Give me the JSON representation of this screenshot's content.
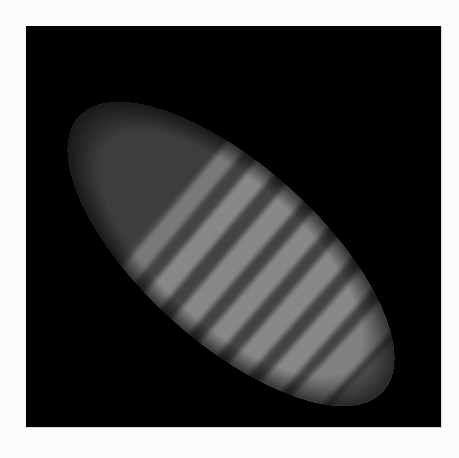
{
  "image": {
    "subject": "fluorescence micrograph of elongated embryo with striped banding",
    "background_color": "#000000",
    "margin_color": "#fbfbfb",
    "stripe_color": "#8a8a8a",
    "body_color": "#1e1e1e",
    "stripe_count": 7
  }
}
